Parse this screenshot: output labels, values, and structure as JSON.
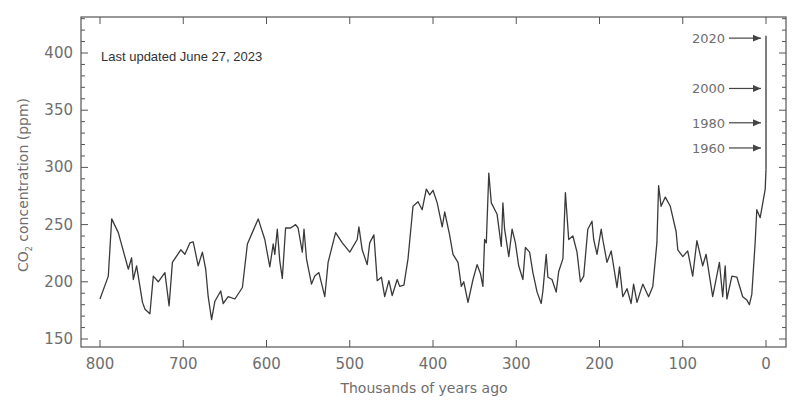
{
  "chart_data": {
    "type": "line",
    "title": "",
    "annotation": "Last updated June 27, 2023",
    "xlabel": "Thousands of years ago",
    "ylabel_main": "CO",
    "ylabel_sub": "2",
    "ylabel_rest": " concentration (ppm)",
    "xlim": [
      800,
      0
    ],
    "ylim": [
      150,
      430
    ],
    "x_ticks": [
      800,
      700,
      600,
      500,
      400,
      300,
      200,
      100,
      0
    ],
    "y_ticks": [
      150,
      200,
      250,
      300,
      350,
      400
    ],
    "x_tick_labels": [
      "800",
      "700",
      "600",
      "500",
      "400",
      "300",
      "200",
      "100",
      "0"
    ],
    "y_tick_labels": [
      "150",
      "200",
      "250",
      "300",
      "350",
      "400"
    ],
    "grid": false,
    "line_color": "#3a3a3a",
    "series": [
      {
        "name": "Ice core CO2",
        "x": [
          800,
          790,
          786,
          778,
          766,
          762,
          760,
          756,
          749,
          746,
          740,
          736,
          730,
          722,
          717,
          713,
          703,
          698,
          692,
          688,
          682,
          677,
          673,
          670,
          666,
          662,
          655,
          652,
          646,
          638,
          629,
          623,
          610,
          602,
          596,
          592,
          590,
          587,
          584,
          581,
          577,
          571,
          565,
          562,
          557,
          555,
          552,
          546,
          542,
          537,
          530,
          526,
          517,
          509,
          500,
          491,
          489,
          485,
          479,
          476,
          471,
          467,
          462,
          458,
          453,
          449,
          443,
          440,
          435,
          430,
          424,
          418,
          413,
          408,
          404,
          400,
          395,
          389,
          386,
          380,
          376,
          370,
          366,
          363,
          358,
          352,
          347,
          343,
          340,
          338,
          336,
          333,
          330,
          323,
          318,
          316,
          314,
          309,
          305,
          301,
          297,
          292,
          289,
          284,
          280,
          275,
          270,
          268,
          264,
          262,
          257,
          252,
          249,
          244,
          241,
          237,
          232,
          227,
          223,
          219,
          214,
          209,
          207,
          203,
          198,
          196,
          191,
          186,
          179,
          176,
          172,
          167,
          162,
          159,
          155,
          148,
          141,
          136,
          131,
          129,
          126,
          121,
          115,
          108,
          106,
          100,
          94,
          88,
          83,
          76,
          72,
          64,
          56,
          52,
          49,
          47,
          41,
          35,
          28,
          23,
          20,
          17,
          13,
          11,
          7,
          1,
          0
        ],
        "y": [
          185,
          205,
          255,
          243,
          211,
          221,
          202,
          214,
          182,
          176,
          172,
          205,
          200,
          208,
          179,
          217,
          228,
          224,
          234,
          235,
          214,
          226,
          211,
          187,
          167,
          183,
          192,
          181,
          187,
          185,
          195,
          233,
          255,
          237,
          213,
          233,
          224,
          246,
          218,
          203,
          247,
          247,
          250,
          247,
          226,
          246,
          220,
          198,
          205,
          208,
          187,
          217,
          243,
          234,
          226,
          237,
          248,
          228,
          215,
          234,
          241,
          201,
          204,
          187,
          201,
          188,
          202,
          196,
          197,
          220,
          266,
          270,
          263,
          281,
          276,
          280,
          269,
          248,
          261,
          241,
          224,
          217,
          196,
          200,
          182,
          202,
          215,
          207,
          196,
          237,
          234,
          295,
          269,
          259,
          231,
          269,
          246,
          222,
          246,
          234,
          214,
          202,
          230,
          226,
          208,
          191,
          181,
          192,
          224,
          204,
          202,
          191,
          209,
          220,
          278,
          237,
          240,
          226,
          200,
          205,
          246,
          253,
          237,
          224,
          246,
          237,
          217,
          227,
          195,
          213,
          187,
          194,
          181,
          198,
          182,
          198,
          187,
          196,
          234,
          284,
          266,
          274,
          266,
          244,
          228,
          222,
          227,
          205,
          236,
          214,
          224,
          187,
          217,
          187,
          214,
          185,
          205,
          204,
          187,
          184,
          180,
          189,
          235,
          263,
          256,
          281,
          298
        ]
      },
      {
        "name": "Modern record",
        "x": [
          0,
          0
        ],
        "y": [
          298,
          415
        ]
      }
    ],
    "year_markers": [
      {
        "label": "2020",
        "ppm": 413
      },
      {
        "label": "2000",
        "ppm": 369
      },
      {
        "label": "1980",
        "ppm": 339
      },
      {
        "label": "1960",
        "ppm": 317
      }
    ]
  }
}
